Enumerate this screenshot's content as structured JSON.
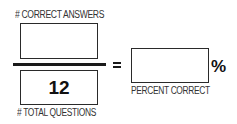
{
  "worksheet": {
    "numerator": {
      "label": "# CORRECT ANSWERS",
      "value": ""
    },
    "denominator": {
      "label": "# TOTAL QUESTIONS",
      "value": "12"
    },
    "operator": "=",
    "result": {
      "label": "PERCENT CORRECT",
      "value": "",
      "unit": "%"
    }
  },
  "colors": {
    "ink": "#1a1a1a",
    "label_text": "#333333",
    "background": "#ffffff"
  }
}
